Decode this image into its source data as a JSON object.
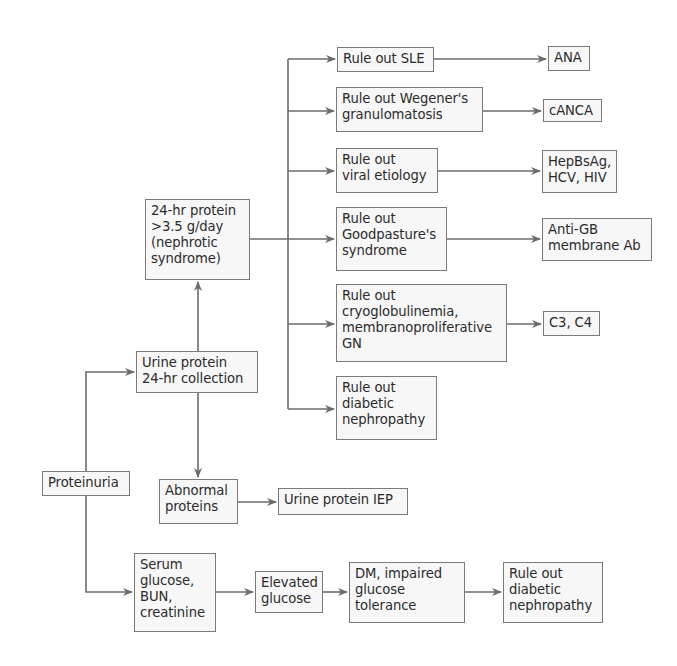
{
  "diagram": {
    "type": "flowchart",
    "colors": {
      "line": "#6b6b6b",
      "box_border": "#7a7a7a",
      "box_fill": "#f7f7f7",
      "text": "#2b2b2b"
    },
    "nodes": {
      "proteinuria": "Proteinuria",
      "urine_protein": "Urine protein\n24-hr collection",
      "nephrotic": "24-hr protein\n>3.5 g/day\n(nephrotic\nsyndrome)",
      "abnormal_proteins": "Abnormal\nproteins",
      "urine_iep": "Urine protein IEP",
      "sle": "Rule out SLE",
      "ana": "ANA",
      "wegener": "Rule out Wegener's\ngranulomatosis",
      "canca": "cANCA",
      "viral": "Rule out\nviral etiology",
      "hep": "HepBsAg,\nHCV, HIV",
      "goodpasture": "Rule out\nGoodpasture's\nsyndrome",
      "antigb": "Anti-GB\nmembrane Ab",
      "cryo": "Rule out\ncryoglobulinemia,\nmembranoproliferative\nGN",
      "c3c4": "C3, C4",
      "diabetic_upper": "Rule out\ndiabetic\nnephropathy",
      "serum": "Serum\nglucose,\nBUN,\ncreatinine",
      "elevated": "Elevated\nglucose",
      "dm": "DM, impaired\nglucose\ntolerance",
      "diabetic_lower": "Rule out\ndiabetic\nnephropathy"
    },
    "edges": [
      [
        "Proteinuria",
        "Urine protein 24-hr collection"
      ],
      [
        "Proteinuria",
        "Serum glucose, BUN, creatinine"
      ],
      [
        "Urine protein 24-hr collection",
        "24-hr protein >3.5 g/day (nephrotic syndrome)"
      ],
      [
        "Urine protein 24-hr collection",
        "Abnormal proteins"
      ],
      [
        "Abnormal proteins",
        "Urine protein IEP"
      ],
      [
        "24-hr protein >3.5 g/day (nephrotic syndrome)",
        "Rule out SLE"
      ],
      [
        "24-hr protein >3.5 g/day (nephrotic syndrome)",
        "Rule out Wegener's granulomatosis"
      ],
      [
        "24-hr protein >3.5 g/day (nephrotic syndrome)",
        "Rule out viral etiology"
      ],
      [
        "24-hr protein >3.5 g/day (nephrotic syndrome)",
        "Rule out Goodpasture's syndrome"
      ],
      [
        "24-hr protein >3.5 g/day (nephrotic syndrome)",
        "Rule out cryoglobulinemia, membranoproliferative GN"
      ],
      [
        "24-hr protein >3.5 g/day (nephrotic syndrome)",
        "Rule out diabetic nephropathy"
      ],
      [
        "Rule out SLE",
        "ANA"
      ],
      [
        "Rule out Wegener's granulomatosis",
        "cANCA"
      ],
      [
        "Rule out viral etiology",
        "HepBsAg, HCV, HIV"
      ],
      [
        "Rule out Goodpasture's syndrome",
        "Anti-GB membrane Ab"
      ],
      [
        "Rule out cryoglobulinemia, membranoproliferative GN",
        "C3, C4"
      ],
      [
        "Serum glucose, BUN, creatinine",
        "Elevated glucose"
      ],
      [
        "Elevated glucose",
        "DM, impaired glucose tolerance"
      ],
      [
        "DM, impaired glucose tolerance",
        "Rule out diabetic nephropathy"
      ]
    ]
  }
}
